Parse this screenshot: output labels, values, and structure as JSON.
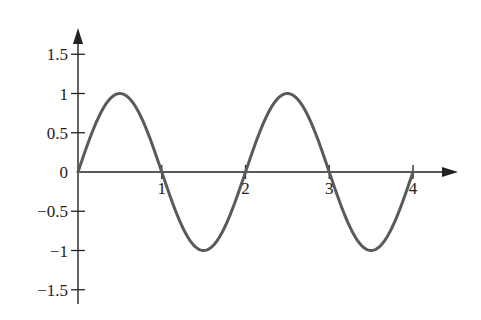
{
  "chart_data": {
    "type": "line",
    "title": "",
    "xlabel": "",
    "ylabel": "",
    "function": "y = sin(pi * x)",
    "x_ticks": [
      1,
      2,
      3,
      4
    ],
    "x_tick_labels": [
      "1",
      "2",
      "3",
      "4"
    ],
    "y_ticks": [
      1.5,
      1,
      0.5,
      0,
      -0.5,
      -1,
      -1.5
    ],
    "y_tick_labels": [
      "1.5",
      "1",
      "0.5",
      "0",
      "−0.5",
      "−1",
      "−1.5"
    ],
    "xlim": [
      0,
      4.5
    ],
    "ylim": [
      -1.65,
      1.8
    ],
    "grid": false,
    "legend": null,
    "series": [
      {
        "name": "sine wave",
        "color": "#5a5a5a",
        "x": [
          0,
          0.25,
          0.5,
          0.75,
          1,
          1.25,
          1.5,
          1.75,
          2,
          2.25,
          2.5,
          2.75,
          3,
          3.25,
          3.5,
          3.75,
          4
        ],
        "y": [
          0,
          0.707,
          1,
          0.707,
          0,
          -0.707,
          -1,
          -0.707,
          0,
          0.707,
          1,
          0.707,
          0,
          -0.707,
          -1,
          -0.707,
          0
        ]
      }
    ]
  },
  "layout": {
    "origin_px": [
      78,
      172
    ],
    "x_unit_px": 83.75,
    "y_unit_px": 78.5,
    "x_axis_end_px": 458,
    "y_axis_top_px": 28,
    "y_axis_bottom_px": 304,
    "axis_color": "#222222",
    "curve_color": "#5a5a5a"
  }
}
